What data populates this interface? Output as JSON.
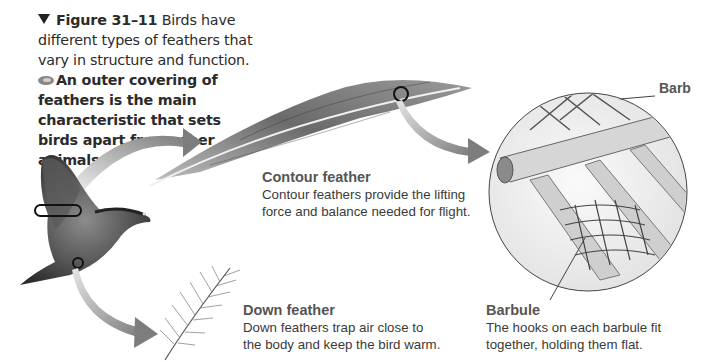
{
  "caption": {
    "figure_number": "Figure 31–11",
    "text": "Birds have different types of feathers that vary in structure and function.",
    "key_icon": "key-concept-icon",
    "bold_statement": "An outer covering of feathers is the main characteristic that sets birds apart from other animals."
  },
  "labels": {
    "contour": {
      "title": "Contour feather",
      "description": "Contour feathers provide the lifting force and balance needed for flight."
    },
    "down": {
      "title": "Down feather",
      "description": "Down feathers trap air close to the body and keep the bird warm."
    },
    "barbule": {
      "title": "Barbule",
      "description": "The hooks on each barbule fit together, holding them flat."
    },
    "barb": "Barb"
  },
  "illustrations": [
    "pigeon-in-flight",
    "contour-feather",
    "down-feather",
    "barb-barbule-magnified-circle"
  ],
  "colors": {
    "arrow": "#8a8a8a",
    "text": "#3a3a3a",
    "label_title": "#555555"
  }
}
